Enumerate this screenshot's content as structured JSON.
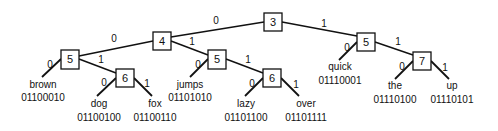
{
  "diagram": {
    "type": "binary-trie",
    "nodes": {
      "root": {
        "label": "3"
      },
      "n4": {
        "label": "4"
      },
      "n5a": {
        "label": "5"
      },
      "n6a": {
        "label": "6"
      },
      "n5b": {
        "label": "5"
      },
      "n6b": {
        "label": "6"
      },
      "n5c": {
        "label": "5"
      },
      "n7": {
        "label": "7"
      }
    },
    "edges": {
      "root_n4": "0",
      "root_n5c": "1",
      "n4_n5a": "0",
      "n4_n5b": "1",
      "n5a_brown": "0",
      "n5a_n6a": "1",
      "n6a_dog": "0",
      "n6a_fox": "1",
      "n5b_jumps": "0",
      "n5b_n6b": "1",
      "n6b_lazy": "0",
      "n6b_over": "1",
      "n5c_quick": "0",
      "n5c_n7": "1",
      "n7_the": "0",
      "n7_up": "1"
    },
    "leaves": {
      "brown": {
        "word": "brown",
        "code": "01100010"
      },
      "dog": {
        "word": "dog",
        "code": "01100100"
      },
      "fox": {
        "word": "fox",
        "code": "01100110"
      },
      "jumps": {
        "word": "jumps",
        "code": "01101010"
      },
      "lazy": {
        "word": "lazy",
        "code": "01101100"
      },
      "over": {
        "word": "over",
        "code": "01101111"
      },
      "quick": {
        "word": "quick",
        "code": "01110001"
      },
      "the": {
        "word": "the",
        "code": "01110100"
      },
      "up": {
        "word": "up",
        "code": "01110101"
      }
    }
  }
}
